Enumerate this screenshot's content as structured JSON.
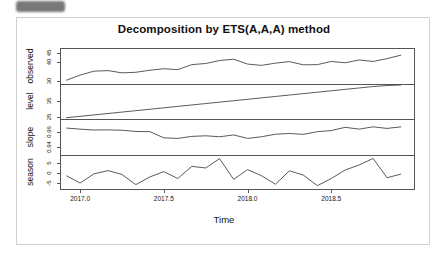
{
  "top_badge": {
    "label": "",
    "color": "#6d6d6d"
  },
  "figure": {
    "title": "Decomposition by ETS(A,A,A) method",
    "xlabel": "Time",
    "line_color": "#3c3c3c",
    "frame_color": "#555555"
  },
  "chart_data": {
    "type": "line",
    "title": "Decomposition by ETS(A,A,A) method",
    "xlabel": "Time",
    "ylabel": "",
    "grid": false,
    "legend": "none",
    "layout": "4 stacked panels sharing one x axis",
    "x_axis": {
      "ticks": [
        2017.0,
        2017.5,
        2018.0,
        2018.5
      ],
      "tick_labels": [
        "2017.0",
        "2017.5",
        "2018.0",
        "2018.5"
      ],
      "xlim": [
        2016.88,
        2019.0
      ]
    },
    "x": [
      2016.917,
      2017.0,
      2017.083,
      2017.167,
      2017.25,
      2017.333,
      2017.417,
      2017.5,
      2017.583,
      2017.667,
      2017.75,
      2017.833,
      2017.917,
      2018.0,
      2018.083,
      2018.167,
      2018.25,
      2018.333,
      2018.417,
      2018.5,
      2018.583,
      2018.667,
      2018.75,
      2018.833,
      2018.917
    ],
    "panels": [
      {
        "name": "observed",
        "ylabel": "observed",
        "ytick_labels": [
          "45",
          "30"
        ],
        "ytick_values": [
          45,
          30
        ],
        "extra_tick_labels": [
          "40"
        ],
        "ylim": [
          28.5,
          47.5
        ],
        "values": [
          30.2,
          33.0,
          35.1,
          35.4,
          34.2,
          34.5,
          35.6,
          36.4,
          35.9,
          38.6,
          39.2,
          40.8,
          41.5,
          38.9,
          38.2,
          39.4,
          40.2,
          38.5,
          38.6,
          40.3,
          39.6,
          41.1,
          40.3,
          41.8,
          43.7
        ]
      },
      {
        "name": "level",
        "ylabel": "level",
        "ytick_labels": [
          "35",
          "25"
        ],
        "ytick_values": [
          35,
          25
        ],
        "ylim": [
          23.5,
          46.0
        ],
        "values": [
          24.6,
          25.5,
          26.4,
          27.3,
          28.2,
          29.1,
          30.0,
          30.9,
          31.8,
          32.7,
          33.6,
          34.5,
          35.4,
          36.3,
          37.2,
          38.1,
          39.0,
          39.9,
          40.8,
          41.7,
          42.6,
          43.5,
          44.4,
          45.0,
          45.4
        ]
      },
      {
        "name": "slope",
        "ylabel": "slope",
        "ytick_labels": [
          "0.96",
          "0.94"
        ],
        "ytick_values": [
          0.96,
          0.94
        ],
        "ylim": [
          0.929,
          0.978
        ],
        "values": [
          0.9655,
          0.964,
          0.9628,
          0.963,
          0.9625,
          0.9608,
          0.9605,
          0.952,
          0.9512,
          0.954,
          0.9548,
          0.9535,
          0.956,
          0.9512,
          0.9535,
          0.957,
          0.958,
          0.9568,
          0.9605,
          0.962,
          0.9665,
          0.964,
          0.9672,
          0.965,
          0.9672
        ]
      },
      {
        "name": "season",
        "ylabel": "season",
        "ytick_labels": [
          "5",
          "0",
          "-5"
        ],
        "ytick_values": [
          5,
          0,
          -5
        ],
        "ylim": [
          -8.5,
          9.0
        ],
        "values": [
          -1.2,
          -4.8,
          -0.3,
          1.3,
          -0.6,
          -5.6,
          -1.8,
          0.8,
          -2.6,
          3.4,
          2.6,
          7.2,
          -3.0,
          1.8,
          -1.2,
          -5.4,
          1.2,
          -0.9,
          -6.1,
          -2.6,
          1.6,
          4.1,
          7.3,
          -2.2,
          -0.4
        ]
      }
    ]
  }
}
